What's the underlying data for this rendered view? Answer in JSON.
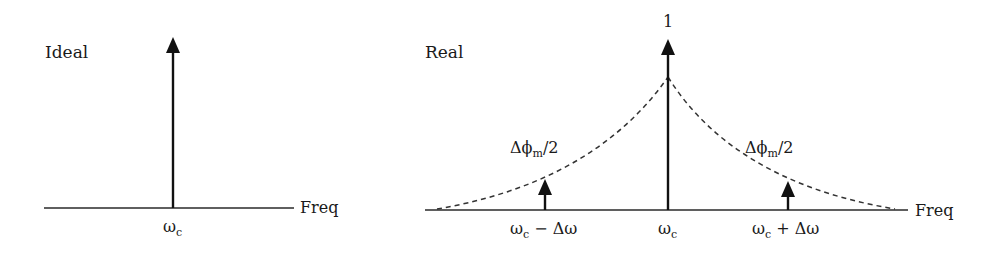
{
  "diagram": {
    "colors": {
      "ink": "#111111",
      "background": "#ffffff"
    },
    "panels": [
      {
        "id": "ideal",
        "title": "Ideal",
        "axis_label": "Freq",
        "baseline": {
          "x1": 44,
          "x2": 294,
          "y": 208
        },
        "title_pos": {
          "x": 45,
          "y": 58
        },
        "axis_label_pos": {
          "x": 300,
          "y": 213
        },
        "arrows": [
          {
            "name": "carrier",
            "x": 173,
            "tip_y": 38,
            "label": "ω",
            "label_sub": "c",
            "label_x": 163,
            "label_y": 232
          }
        ]
      },
      {
        "id": "real",
        "title": "Real",
        "axis_label": "Freq",
        "peak_label": "1",
        "peak_label_pos": {
          "x": 663,
          "y": 27
        },
        "baseline": {
          "x1": 425,
          "x2": 908,
          "y": 210
        },
        "title_pos": {
          "x": 425,
          "y": 58
        },
        "axis_label_pos": {
          "x": 915,
          "y": 216
        },
        "envelope": {
          "style": "dashed",
          "left_x": 437,
          "right_x": 895,
          "peak_x": 668,
          "peak_y": 77
        },
        "arrows": [
          {
            "name": "carrier",
            "x": 668,
            "tip_y": 40,
            "label": "ω",
            "label_sub": "c",
            "label_x": 658,
            "label_y": 234
          },
          {
            "name": "lower-sideband",
            "x": 545,
            "tip_y": 180,
            "label": "ω",
            "label_sub": "c",
            "label_tail": " − Δω",
            "label_x": 510,
            "label_y": 234,
            "amp_label": "Δϕ",
            "amp_sub": "m",
            "amp_tail": "/2",
            "amp_x": 510,
            "amp_y": 153
          },
          {
            "name": "upper-sideband",
            "x": 788,
            "tip_y": 182,
            "label": "ω",
            "label_sub": "c",
            "label_tail": " + Δω",
            "label_x": 752,
            "label_y": 234,
            "amp_label": "Δϕ",
            "amp_sub": "m",
            "amp_tail": "/2",
            "amp_x": 745,
            "amp_y": 153
          }
        ]
      }
    ]
  }
}
